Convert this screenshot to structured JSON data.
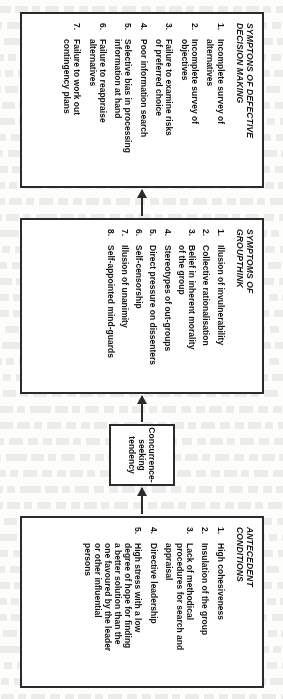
{
  "diagram": {
    "type": "flowchart",
    "orientation": "rotated-90-sideways-on-page",
    "flow_direction": "antecedent-conditions -> concurrence-seeking-tendency -> symptoms-of-groupthink -> symptoms-of-defective-decision-making",
    "boxes": {
      "antecedent": {
        "title": "ANTECEDENT\nCONDITIONS",
        "items": [
          {
            "num": "1.",
            "text": "High cohesiveness"
          },
          {
            "num": "2.",
            "text": "Insulation of the group"
          },
          {
            "num": "3.",
            "text": "Lack of methodical\nprocedures for search and\nappraisal"
          },
          {
            "num": "4.",
            "text": "Directive leadership"
          },
          {
            "num": "5.",
            "text": "High stress with a low\ndegree of hope for finding\na better solution than the\none favoured by the leader\nor other influential\npersons"
          }
        ]
      },
      "concurrence": {
        "label": "Concurrence-\nseeking\ntendency"
      },
      "groupthink": {
        "title": "SYMPTOMS OF\nGROUPTHINK",
        "items": [
          {
            "num": "1.",
            "text": "Illusion of invulnerability"
          },
          {
            "num": "2.",
            "text": "Collective rationalisation"
          },
          {
            "num": "3.",
            "text": "Belief in inherent morality\nof the group"
          },
          {
            "num": "4.",
            "text": "Stereotypes of out-groups"
          },
          {
            "num": "5.",
            "text": "Direct pressure on dissenters"
          },
          {
            "num": "6.",
            "text": "Self-censorship"
          },
          {
            "num": "7.",
            "text": "Illusion of unanimity"
          },
          {
            "num": "8.",
            "text": "Self-appointed mind-guards"
          }
        ]
      },
      "defective": {
        "title": "SYMPTONS OF DEFECTIVE\nDECISION MAKING",
        "items": [
          {
            "num": "1.",
            "text": "Incomplete survey of\nalternatives"
          },
          {
            "num": "2.",
            "text": "Incomplete survey of\nobjectives"
          },
          {
            "num": "3.",
            "text": "Failure to examine risks\nof preferred choice"
          },
          {
            "num": "4.",
            "text": "Poor information search"
          },
          {
            "num": "5.",
            "text": "Selective bias in processing\ninformation at hand"
          },
          {
            "num": "6.",
            "text": "Failure to reappraise\nalternatives"
          },
          {
            "num": "7.",
            "text": "Failure to work out\ncontingency plans"
          }
        ]
      }
    },
    "colors": {
      "ink": "#2b2b2b",
      "text": "#111111",
      "paper": "#fdfdfc"
    }
  }
}
